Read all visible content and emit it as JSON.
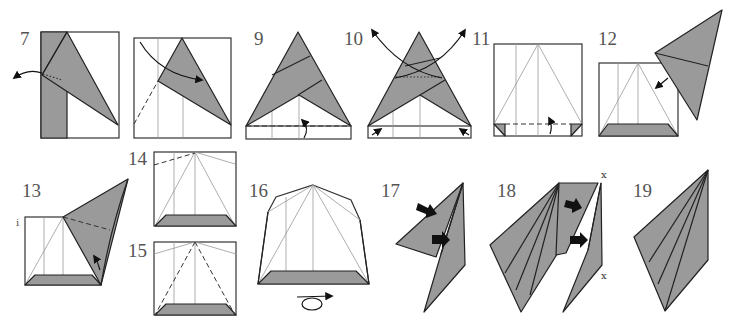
{
  "diagram": {
    "type": "origami folding instructions",
    "fill_color": "#9a9a9a",
    "line_color": "#222222",
    "steps": [
      {
        "number": "7",
        "description": "Unfold flap (arrow left)"
      },
      {
        "number": "8",
        "description": "Fold along dashed valley line"
      },
      {
        "number": "9",
        "description": "Fold bottom strip up along dashed line"
      },
      {
        "number": "10",
        "description": "Unfold both flaps (arrows up)"
      },
      {
        "number": "11",
        "description": "Fold bottom strip up"
      },
      {
        "number": "12",
        "description": "Insert flap into pocket"
      },
      {
        "number": "13",
        "description": "Fold along dashed line"
      },
      {
        "number": "14",
        "description": "Fold along dashed line"
      },
      {
        "number": "15",
        "description": "Valley fold along dashed lines"
      },
      {
        "number": "16",
        "description": "Turn over"
      },
      {
        "number": "17",
        "description": "Push in at arrows"
      },
      {
        "number": "18",
        "description": "Push in at arrows, join x to x"
      },
      {
        "number": "19",
        "description": "Finished unit"
      }
    ],
    "marks": {
      "x_top": "x",
      "x_bottom": "x"
    }
  }
}
